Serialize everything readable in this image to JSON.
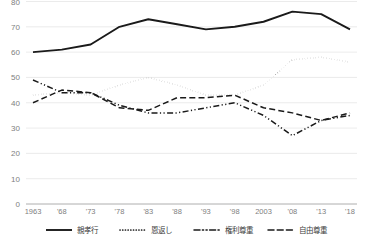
{
  "chart_data": {
    "type": "line",
    "title": "",
    "xlabel": "",
    "ylabel": "",
    "ylim": [
      0,
      80
    ],
    "ytick_step": 10,
    "grid": true,
    "legend_position": "bottom",
    "x": [
      1963,
      1968,
      1973,
      1978,
      1983,
      1988,
      1993,
      1998,
      2003,
      2008,
      2013,
      2018
    ],
    "categories": [
      "1963",
      "'68",
      "'73",
      "'78",
      "'83",
      "'88",
      "'93",
      "'98",
      "2003",
      "'08",
      "'13",
      "'18"
    ],
    "yticks": [
      "0",
      "10",
      "20",
      "30",
      "40",
      "50",
      "60",
      "70",
      "80"
    ],
    "ytick_values": [
      0,
      10,
      20,
      30,
      40,
      50,
      60,
      70,
      80
    ],
    "series": [
      {
        "name": "親孝行",
        "style": "solid",
        "color": "#1a1a1a",
        "values": [
          60,
          61,
          63,
          70,
          73,
          71,
          69,
          70,
          72,
          76,
          75,
          69
        ]
      },
      {
        "name": "恩返し",
        "style": "dotted",
        "color": "#1a1a1a",
        "values": [
          43,
          44,
          43,
          47,
          50,
          47,
          43,
          43,
          47,
          57,
          58,
          56
        ]
      },
      {
        "name": "権利尊重",
        "style": "dashdot",
        "color": "#1a1a1a",
        "values": [
          49,
          44,
          44,
          39,
          36,
          36,
          38,
          40,
          35,
          27,
          33,
          35
        ]
      },
      {
        "name": "自由尊重",
        "style": "dashed",
        "color": "#1a1a1a",
        "values": [
          40,
          45,
          44,
          38,
          37,
          42,
          42,
          43,
          38,
          36,
          33,
          36
        ]
      }
    ]
  },
  "legend": {
    "items": [
      {
        "label": "親孝行",
        "style": "solid"
      },
      {
        "label": "恩返し",
        "style": "dotted"
      },
      {
        "label": "権利尊重",
        "style": "dashdot"
      },
      {
        "label": "自由尊重",
        "style": "dashed"
      }
    ]
  },
  "footer": {
    "source": ""
  }
}
